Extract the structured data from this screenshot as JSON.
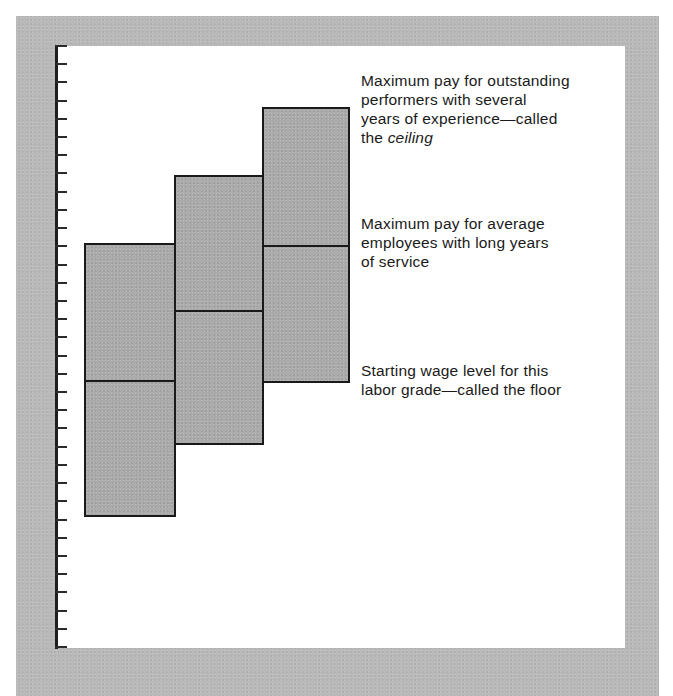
{
  "top_text_cutoff": "Figure: pay range structure for labor grades",
  "colors": {
    "frame": "#b9b9b9",
    "panel": "#ffffff",
    "bar_fill": "#ababab",
    "lines": "#1a1a1a"
  },
  "axis": {
    "tick_count": 34,
    "tick_labels": []
  },
  "annotations": {
    "ceiling": {
      "line1": "Maximum pay for outstanding",
      "line2": "performers with several",
      "line3": "years of experience—called",
      "line4_prefix": "the ",
      "line4_italic": "ceiling"
    },
    "average_max": {
      "line1": "Maximum pay for average",
      "line2": "employees with long years",
      "line3": "of service"
    },
    "floor": {
      "line1": "Starting wage level for this",
      "line2": "labor grade—called the floor"
    }
  },
  "chart_data": {
    "type": "diagram",
    "title": "",
    "xlabel": "",
    "ylabel": "",
    "grid": false,
    "y_axis": {
      "ticks": 34,
      "tick_labels": []
    },
    "units": "tick marks from bottom (0) to top (33)",
    "series": [
      {
        "name": "Labor grade 1",
        "floor": 7.4,
        "midpoint": 14.9,
        "ceiling": 22.3
      },
      {
        "name": "Labor grade 2",
        "floor": 11.4,
        "midpoint": 18.8,
        "ceiling": 26.1
      },
      {
        "name": "Labor grade 3",
        "floor": 14.8,
        "midpoint": 22.3,
        "ceiling": 29.8
      }
    ],
    "annotations": [
      "Maximum pay for outstanding performers with several years of experience—called the ceiling",
      "Maximum pay for average employees with long years of service",
      "Starting wage level for this labor grade—called the floor"
    ]
  }
}
